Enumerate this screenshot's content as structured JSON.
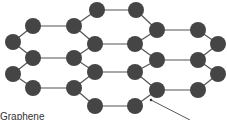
{
  "diagram": {
    "title": "Graphene",
    "label": "Graphene",
    "colors": {
      "node": "#454545",
      "edge": "#555555",
      "background": "#ffffff"
    },
    "nodes": [
      [
        97,
        10
      ],
      [
        136,
        10
      ],
      [
        33,
        26
      ],
      [
        74,
        26
      ],
      [
        157,
        30
      ],
      [
        198,
        30
      ],
      [
        13,
        42
      ],
      [
        95,
        44
      ],
      [
        135,
        44
      ],
      [
        218,
        44
      ],
      [
        33,
        58
      ],
      [
        74,
        58
      ],
      [
        157,
        60
      ],
      [
        198,
        60
      ],
      [
        13,
        74
      ],
      [
        95,
        72
      ],
      [
        135,
        72
      ],
      [
        218,
        74
      ],
      [
        33,
        88
      ],
      [
        74,
        88
      ],
      [
        157,
        90
      ],
      [
        198,
        90
      ],
      [
        95,
        106
      ],
      [
        135,
        106
      ]
    ],
    "edges": [
      [
        0,
        1
      ],
      [
        0,
        3
      ],
      [
        1,
        4
      ],
      [
        2,
        3
      ],
      [
        2,
        6
      ],
      [
        3,
        7
      ],
      [
        4,
        5
      ],
      [
        4,
        8
      ],
      [
        5,
        9
      ],
      [
        7,
        8
      ],
      [
        6,
        10
      ],
      [
        7,
        11
      ],
      [
        8,
        12
      ],
      [
        9,
        13
      ],
      [
        10,
        11
      ],
      [
        12,
        13
      ],
      [
        10,
        14
      ],
      [
        11,
        15
      ],
      [
        12,
        16
      ],
      [
        13,
        17
      ],
      [
        15,
        16
      ],
      [
        14,
        18
      ],
      [
        15,
        19
      ],
      [
        16,
        20
      ],
      [
        17,
        21
      ],
      [
        18,
        19
      ],
      [
        20,
        21
      ],
      [
        19,
        22
      ],
      [
        20,
        23
      ],
      [
        22,
        23
      ]
    ],
    "pointer": {
      "from": [
        151,
        100
      ],
      "to": [
        190,
        120
      ]
    }
  }
}
